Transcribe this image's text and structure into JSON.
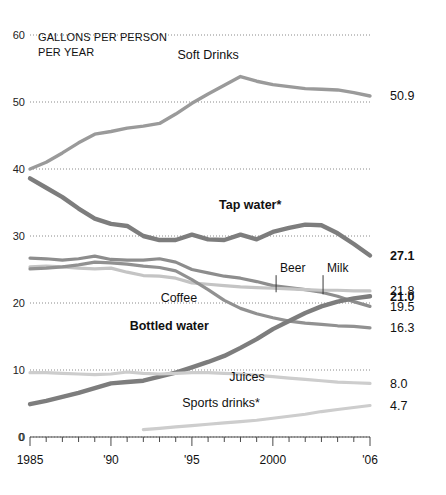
{
  "header": {
    "unit_line1": "GALLONS PER PERSON",
    "unit_line2": "PER YEAR"
  },
  "chart_data": {
    "type": "line",
    "title": "",
    "xlabel": "",
    "ylabel": "GALLONS PER PERSON PER YEAR",
    "xlim": [
      1985,
      2006
    ],
    "ylim": [
      0,
      60
    ],
    "grid": true,
    "grid_style": "dotted-horizontal",
    "legend_position": "inline-annotations",
    "x": [
      1985,
      1986,
      1987,
      1988,
      1989,
      1990,
      1991,
      1992,
      1993,
      1994,
      1995,
      1996,
      1997,
      1998,
      1999,
      2000,
      2001,
      2002,
      2003,
      2004,
      2005,
      2006
    ],
    "y_ticks": [
      0,
      10,
      20,
      30,
      40,
      50,
      60
    ],
    "x_ticks": [
      1985,
      1990,
      1995,
      2000,
      2006
    ],
    "x_tick_labels": [
      "1985",
      "'90",
      "'95",
      "2000",
      "'06"
    ],
    "series": [
      {
        "name": "Soft Drinks",
        "label": "Soft Drinks",
        "label_bold": false,
        "end_value": "50.9",
        "end_value_bold": false,
        "color": "#9a9a9a",
        "width": 3.4,
        "label_x": 1996.0,
        "label_y": 56.4,
        "values": [
          40.0,
          41.0,
          42.4,
          43.9,
          45.2,
          45.6,
          46.1,
          46.4,
          46.8,
          48.2,
          49.8,
          51.2,
          52.5,
          53.8,
          53.1,
          52.6,
          52.3,
          52.0,
          51.9,
          51.8,
          51.4,
          50.9
        ]
      },
      {
        "name": "Tap water",
        "label": "Tap water*",
        "label_bold": true,
        "end_value": "27.1",
        "end_value_bold": true,
        "color": "#7d7d7d",
        "width": 4.4,
        "label_x": 1998.6,
        "label_y": 34.0,
        "values": [
          38.6,
          37.2,
          35.8,
          34.1,
          32.6,
          31.8,
          31.5,
          30.0,
          29.4,
          29.4,
          30.2,
          29.5,
          29.4,
          30.2,
          29.5,
          30.6,
          31.2,
          31.7,
          31.6,
          30.4,
          28.8,
          27.1
        ]
      },
      {
        "name": "Milk",
        "label": "Milk",
        "label_bold": false,
        "end_value": "19.5",
        "end_value_bold": false,
        "color": "#8d8d8d",
        "width": 3.2,
        "callout": true,
        "callout_x": 2003.1,
        "callout_label_y": 24.6,
        "callout_tip_y": 21.3,
        "values": [
          26.7,
          26.6,
          26.4,
          26.6,
          27.0,
          26.5,
          26.4,
          26.4,
          26.6,
          26.1,
          25.0,
          24.5,
          24.0,
          23.7,
          23.2,
          22.6,
          22.3,
          22.0,
          21.6,
          21.0,
          20.2,
          19.5
        ]
      },
      {
        "name": "Beer",
        "label": "Beer",
        "label_bold": false,
        "end_value": "21.8",
        "end_value_bold": false,
        "color": "#c4c4c4",
        "width": 3.2,
        "callout": true,
        "callout_x": 2000.2,
        "callout_label_y": 24.6,
        "callout_tip_y": 21.6,
        "values": [
          25.4,
          25.5,
          25.4,
          25.2,
          25.1,
          25.2,
          24.6,
          24.1,
          24.0,
          23.7,
          23.0,
          22.8,
          22.6,
          22.4,
          22.3,
          22.2,
          22.1,
          22.0,
          21.9,
          21.9,
          21.8,
          21.8
        ]
      },
      {
        "name": "Coffee",
        "label": "Coffee",
        "label_bold": false,
        "end_value": "16.3",
        "end_value_bold": false,
        "color": "#919191",
        "width": 3.2,
        "label_x": 1994.2,
        "label_y": 20.2,
        "values": [
          25.1,
          25.2,
          25.4,
          25.7,
          26.1,
          26.0,
          25.8,
          25.5,
          25.3,
          24.8,
          23.5,
          22.0,
          20.4,
          19.2,
          18.4,
          17.8,
          17.3,
          17.0,
          16.8,
          16.6,
          16.5,
          16.3
        ]
      },
      {
        "name": "Bottled water",
        "label": "Bottled water",
        "label_bold": true,
        "end_value": "21.0",
        "end_value_bold": true,
        "color": "#7d7d7d",
        "width": 4.4,
        "label_x": 1993.6,
        "label_y": 15.9,
        "values": [
          4.9,
          5.4,
          6.0,
          6.6,
          7.3,
          8.0,
          8.2,
          8.4,
          9.0,
          9.6,
          10.4,
          11.2,
          12.1,
          13.3,
          14.6,
          16.1,
          17.3,
          18.5,
          19.5,
          20.2,
          20.7,
          21.0
        ]
      },
      {
        "name": "Juices",
        "label": "Juices",
        "label_bold": false,
        "end_value": "8.0",
        "end_value_bold": false,
        "color": "#cdcdcd",
        "width": 3.2,
        "label_x": 1998.4,
        "label_y": 8.3,
        "values": [
          9.6,
          9.6,
          9.5,
          9.4,
          9.3,
          9.4,
          9.7,
          9.5,
          9.4,
          9.5,
          9.6,
          9.6,
          9.5,
          9.4,
          9.2,
          9.0,
          8.8,
          8.6,
          8.4,
          8.2,
          8.1,
          8.0
        ]
      },
      {
        "name": "Sports drinks",
        "label": "Sports drinks*",
        "label_bold": false,
        "end_value": "4.7",
        "end_value_bold": false,
        "color": "#cdcdcd",
        "width": 3.2,
        "label_x": 1996.8,
        "label_y": 4.5,
        "start_index": 7,
        "values": [
          null,
          null,
          null,
          null,
          null,
          null,
          null,
          1.1,
          1.3,
          1.5,
          1.7,
          1.9,
          2.1,
          2.3,
          2.5,
          2.8,
          3.1,
          3.4,
          3.8,
          4.1,
          4.4,
          4.7
        ]
      }
    ]
  }
}
